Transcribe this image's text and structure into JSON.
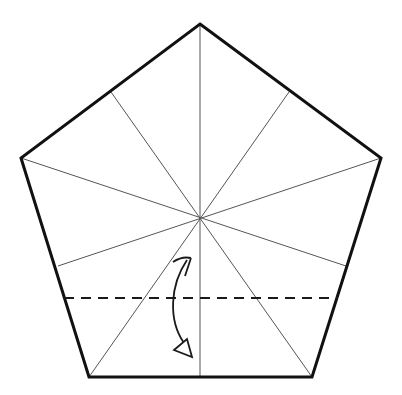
{
  "diagram": {
    "type": "origami-crease-pattern",
    "shape": "regular-pentagon",
    "colors": {
      "background": "#ffffff",
      "outline": "#111111",
      "crease": "#555555",
      "fold_line": "#1a1a1a",
      "arrow": "#1a1a1a"
    },
    "pentagon": {
      "vertices": [
        [
          200,
          24
        ],
        [
          381,
          158
        ],
        [
          312,
          377
        ],
        [
          89,
          377
        ],
        [
          21,
          158
        ]
      ]
    },
    "center": [
      200,
      219
    ],
    "creases": [
      [
        200,
        24,
        200,
        377
      ],
      [
        111,
        92,
        312,
        377
      ],
      [
        289,
        92,
        89,
        377
      ],
      [
        21,
        158,
        346,
        266
      ],
      [
        381,
        158,
        58,
        266
      ]
    ],
    "valley_fold": {
      "y": 298,
      "x1": 64,
      "x2": 338,
      "dash": "10,7"
    },
    "fold_arrow": {
      "description": "curved arrow indicating fold bottom edge up along dashed valley line",
      "start": [
        190,
        259
      ],
      "end": [
        189,
        352
      ]
    }
  }
}
